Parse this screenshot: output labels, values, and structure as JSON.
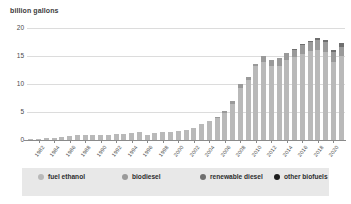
{
  "chart_data": {
    "type": "bar",
    "stacked": true,
    "title": "billion gallons",
    "ylabel": "billion gallons",
    "xlabel": "",
    "ylim": [
      0,
      20
    ],
    "yticks": [
      0,
      5,
      10,
      15,
      20
    ],
    "grid": true,
    "legend_position": "bottom",
    "categories": [
      "1981",
      "1982",
      "1983",
      "1984",
      "1985",
      "1986",
      "1987",
      "1988",
      "1989",
      "1990",
      "1991",
      "1992",
      "1993",
      "1994",
      "1995",
      "1996",
      "1997",
      "1998",
      "1999",
      "2000",
      "2001",
      "2002",
      "2003",
      "2004",
      "2005",
      "2006",
      "2007",
      "2008",
      "2009",
      "2010",
      "2011",
      "2012",
      "2013",
      "2014",
      "2015",
      "2016",
      "2017",
      "2018",
      "2019",
      "2020",
      "2021"
    ],
    "xtick_labels": [
      "1982",
      "1984",
      "1986",
      "1988",
      "1990",
      "1992",
      "1994",
      "1996",
      "1998",
      "2000",
      "2002",
      "2004",
      "2006",
      "2008",
      "2010",
      "2012",
      "2014",
      "2016",
      "2018",
      "2020"
    ],
    "series": [
      {
        "name": "fuel ethanol",
        "color": "#b9b9b9",
        "values": [
          0.08,
          0.21,
          0.38,
          0.43,
          0.61,
          0.71,
          0.83,
          0.83,
          0.86,
          0.9,
          0.95,
          1.02,
          1.15,
          1.29,
          1.36,
          0.97,
          1.29,
          1.4,
          1.47,
          1.62,
          1.77,
          2.13,
          2.8,
          3.4,
          3.9,
          4.88,
          6.52,
          9.24,
          10.75,
          13.3,
          13.95,
          13.22,
          13.3,
          14.31,
          14.81,
          15.41,
          15.94,
          16.09,
          15.78,
          13.94,
          15.02
        ]
      },
      {
        "name": "biodiesel",
        "color": "#9a9a9a",
        "values": [
          0,
          0,
          0,
          0,
          0,
          0,
          0,
          0,
          0,
          0,
          0,
          0,
          0,
          0,
          0,
          0,
          0,
          0,
          0,
          0.01,
          0.01,
          0.02,
          0.02,
          0.03,
          0.09,
          0.25,
          0.49,
          0.68,
          0.52,
          0.34,
          0.97,
          0.99,
          1.36,
          1.28,
          1.27,
          1.57,
          1.6,
          1.86,
          1.73,
          1.82,
          1.64
        ]
      },
      {
        "name": "renewable diesel",
        "color": "#6f6f6f",
        "values": [
          0,
          0,
          0,
          0,
          0,
          0,
          0,
          0,
          0,
          0,
          0,
          0,
          0,
          0,
          0,
          0,
          0,
          0,
          0,
          0,
          0,
          0,
          0,
          0,
          0,
          0,
          0,
          0,
          0,
          0,
          0,
          0,
          0,
          0,
          0.1,
          0.13,
          0.15,
          0.26,
          0.36,
          0.4,
          0.59
        ]
      },
      {
        "name": "other biofuels",
        "color": "#1e1e1e",
        "values": [
          0,
          0,
          0,
          0,
          0,
          0,
          0,
          0,
          0,
          0,
          0,
          0,
          0,
          0,
          0,
          0,
          0,
          0,
          0,
          0,
          0,
          0,
          0,
          0,
          0,
          0,
          0,
          0,
          0,
          0,
          0,
          0,
          0,
          0,
          0,
          0.04,
          0.05,
          0.06,
          0.06,
          0.06,
          0.08
        ]
      }
    ],
    "totals": [
      0.08,
      0.21,
      0.38,
      0.43,
      0.61,
      0.71,
      0.83,
      0.83,
      0.86,
      0.9,
      0.95,
      1.02,
      1.15,
      1.29,
      1.36,
      0.97,
      1.29,
      1.4,
      1.47,
      1.63,
      1.78,
      2.15,
      2.82,
      3.43,
      3.99,
      5.13,
      7.01,
      9.92,
      11.27,
      13.64,
      14.92,
      14.21,
      14.66,
      15.59,
      16.18,
      17.15,
      17.74,
      18.27,
      17.93,
      16.22,
      17.33
    ]
  },
  "legend": {
    "items": [
      {
        "label": "fuel ethanol",
        "color": "#b9b9b9"
      },
      {
        "label": "biodiesel",
        "color": "#9a9a9a"
      },
      {
        "label": "renewable diesel",
        "color": "#6f6f6f"
      },
      {
        "label": "other biofuels",
        "color": "#1e1e1e"
      }
    ]
  },
  "colors": {
    "background": "#ffffff",
    "legend_background": "#e8e8e8",
    "gridline": "#dcdcdc",
    "axis": "#8a8a8a",
    "text": "#3d3d3d"
  }
}
